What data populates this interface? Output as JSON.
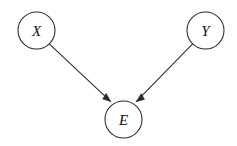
{
  "figure": {
    "kind": "directed-acyclic-graph",
    "background_color": "#ffffff",
    "stroke_color": "#2b2b2b",
    "label_color": "#111111",
    "width": 237,
    "height": 146
  },
  "nodes": [
    {
      "id": "X",
      "label": "X",
      "name": "node-x",
      "cx": 36.5,
      "cy": 30.5,
      "r": 18.5
    },
    {
      "id": "Y",
      "label": "Y",
      "name": "node-y",
      "cx": 205.5,
      "cy": 30.5,
      "r": 18.5
    },
    {
      "id": "E",
      "label": "E",
      "name": "node-e",
      "cx": 123.5,
      "cy": 119.5,
      "r": 18.5
    }
  ],
  "edges": [
    {
      "id": "X-to-E",
      "name": "edge-x-to-e",
      "from": "X",
      "to": "E",
      "direction": "X → E",
      "arrowhead": "filled-triangle",
      "path": "M 49.2 43.8 L 110.8 101.7",
      "head_points": "110.8,101.7 102.6,99.0 106.2,93.2"
    },
    {
      "id": "Y-to-E",
      "name": "edge-y-to-e",
      "from": "Y",
      "to": "E",
      "direction": "Y → E",
      "arrowhead": "filled-triangle",
      "path": "M 192.6 43.8 L 136.2 101.7",
      "head_points": "136.2,101.7 144.6,99.4 141.2,93.4"
    }
  ]
}
